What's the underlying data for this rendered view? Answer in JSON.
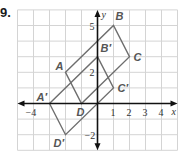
{
  "problem": {
    "number": "9."
  },
  "graph": {
    "origin_px": [
      97.5,
      103.5
    ],
    "unit_px": [
      16,
      15.6
    ],
    "x_range": [
      -5,
      5
    ],
    "y_range": [
      -3,
      6
    ],
    "grid_color": "#d4d4d4",
    "axis_color": "#111111",
    "shape_color": "#6e6e6e",
    "axis_labels": {
      "x": "x",
      "y": "y"
    },
    "x_ticks": [
      {
        "value": -4,
        "label": "−4"
      },
      {
        "value": 1,
        "label": "1"
      },
      {
        "value": 2,
        "label": "2"
      },
      {
        "value": 3,
        "label": "3"
      },
      {
        "value": 4,
        "label": "4"
      }
    ],
    "y_ticks": [
      {
        "value": 5,
        "label": "5"
      },
      {
        "value": 2,
        "label": "2"
      },
      {
        "value": -2,
        "label": "−2"
      }
    ]
  },
  "shapes": [
    {
      "name": "ABCD",
      "points": [
        {
          "label": "A",
          "x": -2,
          "y": 2,
          "dx": -10,
          "dy": -2
        },
        {
          "label": "B",
          "x": 1,
          "y": 5,
          "dx": 2,
          "dy": -6
        },
        {
          "label": "C",
          "x": 2,
          "y": 3,
          "dx": 4,
          "dy": 4
        },
        {
          "label": "D",
          "x": -1,
          "y": 0,
          "dx": -5,
          "dy": 12
        }
      ]
    },
    {
      "name": "A'B'C'D'",
      "points": [
        {
          "label": "A′",
          "x": -3,
          "y": 0,
          "dx": -13,
          "dy": -3
        },
        {
          "label": "B′",
          "x": 0,
          "y": 3,
          "dx": 3,
          "dy": -5
        },
        {
          "label": "C′",
          "x": 1,
          "y": 1,
          "dx": 4,
          "dy": 4
        },
        {
          "label": "D′",
          "x": -2,
          "y": -2,
          "dx": -12,
          "dy": 12
        }
      ]
    }
  ]
}
